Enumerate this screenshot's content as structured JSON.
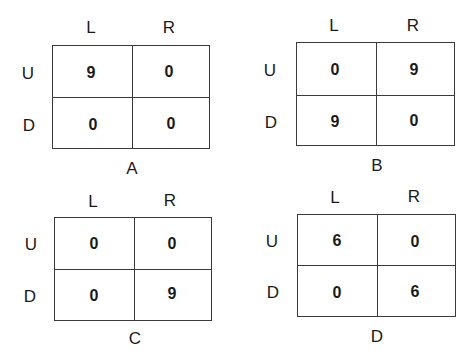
{
  "games": [
    {
      "caption": "A",
      "col_labels": [
        "L",
        "R"
      ],
      "row_labels": [
        "U",
        "D"
      ],
      "payoffs": [
        [
          "9",
          "0"
        ],
        [
          "0",
          "0"
        ]
      ]
    },
    {
      "caption": "B",
      "col_labels": [
        "L",
        "R"
      ],
      "row_labels": [
        "U",
        "D"
      ],
      "payoffs": [
        [
          "0",
          "9"
        ],
        [
          "9",
          "0"
        ]
      ]
    },
    {
      "caption": "C",
      "col_labels": [
        "L",
        "R"
      ],
      "row_labels": [
        "U",
        "D"
      ],
      "payoffs": [
        [
          "0",
          "0"
        ],
        [
          "0",
          "9"
        ]
      ]
    },
    {
      "caption": "D",
      "col_labels": [
        "L",
        "R"
      ],
      "row_labels": [
        "U",
        "D"
      ],
      "payoffs": [
        [
          "6",
          "0"
        ],
        [
          "0",
          "6"
        ]
      ]
    }
  ]
}
